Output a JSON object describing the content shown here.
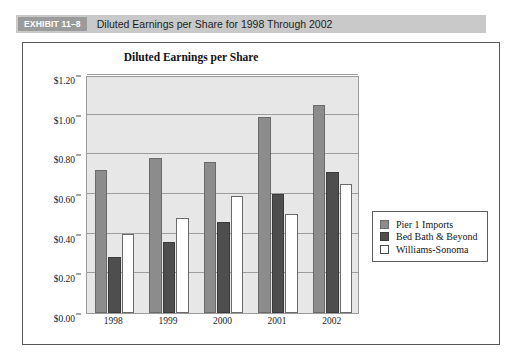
{
  "exhibit": {
    "tag": "EXHIBIT 11–8",
    "title": "Diluted Earnings per Share for 1998 Through 2002"
  },
  "chart_data": {
    "type": "bar",
    "title": "Diluted Earnings per Share",
    "xlabel": "",
    "ylabel": "",
    "categories": [
      "1998",
      "1999",
      "2000",
      "2001",
      "2002"
    ],
    "series": [
      {
        "name": "Pier 1 Imports",
        "color": "#8c8c8c",
        "values": [
          0.72,
          0.78,
          0.76,
          0.99,
          1.05
        ]
      },
      {
        "name": "Bed Bath & Beyond",
        "color": "#4e4e4e",
        "values": [
          0.28,
          0.36,
          0.46,
          0.6,
          0.71
        ]
      },
      {
        "name": "Williams-Sonoma",
        "color": "#ffffff",
        "values": [
          0.4,
          0.48,
          0.59,
          0.5,
          0.65
        ]
      }
    ],
    "ylim": [
      0.0,
      1.2
    ],
    "yticks": [
      0.0,
      0.2,
      0.4,
      0.6,
      0.8,
      1.0,
      1.2
    ],
    "ytick_labels": [
      "$0.00",
      "$0.20",
      "$0.40",
      "$0.60",
      "$0.80",
      "$1.00",
      "$1.20"
    ],
    "grid": true,
    "legend_position": "right",
    "plot_background": "#e7e7e7"
  }
}
